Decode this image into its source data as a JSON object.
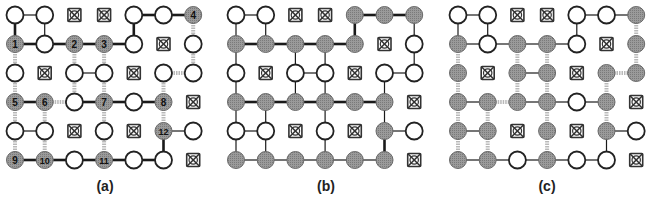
{
  "figure": {
    "grid": {
      "rows": 6,
      "cols": 7,
      "spacing_x": 29.7,
      "spacing_y": 29,
      "node_radius": 8.5
    },
    "colors": {
      "node_stroke": "#222222",
      "node_open_fill": "#ffffff",
      "node_shaded_fill": "#8f8f8f",
      "edge_black": "#1a1a1a",
      "edge_grey": "#b9b9b9",
      "blocked": "#333333",
      "label_text": "#111111"
    },
    "legend": {
      "O": "open node",
      "S": "shaded node",
      "X": "blocked node (crossed)"
    },
    "panels": [
      {
        "id": "a",
        "label": "(a)",
        "origin_x": 15,
        "origin_y": 15,
        "label_x": 105,
        "cells": [
          [
            "O",
            "O",
            "X",
            "X",
            "O",
            "O",
            "S"
          ],
          [
            "S",
            "O",
            "S",
            "S",
            "O",
            "X",
            "O"
          ],
          [
            "O",
            "X",
            "O",
            "O",
            "X",
            "O",
            "O"
          ],
          [
            "S",
            "S",
            "O",
            "S",
            "O",
            "S",
            "X"
          ],
          [
            "O",
            "O",
            "X",
            "O",
            "X",
            "S",
            "O"
          ],
          [
            "S",
            "S",
            "O",
            "S",
            "O",
            "O",
            "X"
          ]
        ],
        "node_numbers": [
          {
            "r": 0,
            "c": 6,
            "n": "4"
          },
          {
            "r": 1,
            "c": 0,
            "n": "1"
          },
          {
            "r": 1,
            "c": 2,
            "n": "2"
          },
          {
            "r": 1,
            "c": 3,
            "n": "3"
          },
          {
            "r": 3,
            "c": 0,
            "n": "5"
          },
          {
            "r": 3,
            "c": 1,
            "n": "6"
          },
          {
            "r": 3,
            "c": 3,
            "n": "7"
          },
          {
            "r": 3,
            "c": 5,
            "n": "8"
          },
          {
            "r": 4,
            "c": 5,
            "n": "12"
          },
          {
            "r": 5,
            "c": 0,
            "n": "9"
          },
          {
            "r": 5,
            "c": 1,
            "n": "10"
          },
          {
            "r": 5,
            "c": 3,
            "n": "11"
          }
        ],
        "edges": [
          [
            0,
            0,
            0,
            1,
            "t"
          ],
          [
            0,
            4,
            0,
            5,
            "b"
          ],
          [
            0,
            5,
            0,
            6,
            "b"
          ],
          [
            0,
            0,
            1,
            0,
            "b"
          ],
          [
            0,
            1,
            1,
            1,
            "t"
          ],
          [
            0,
            4,
            1,
            4,
            "b"
          ],
          [
            0,
            6,
            1,
            6,
            "g"
          ],
          [
            1,
            0,
            1,
            1,
            "b"
          ],
          [
            1,
            1,
            1,
            2,
            "b"
          ],
          [
            1,
            2,
            1,
            3,
            "b"
          ],
          [
            1,
            3,
            1,
            4,
            "b"
          ],
          [
            1,
            0,
            2,
            0,
            "g"
          ],
          [
            1,
            2,
            2,
            2,
            "g"
          ],
          [
            1,
            3,
            2,
            3,
            "g"
          ],
          [
            1,
            6,
            2,
            6,
            "g"
          ],
          [
            2,
            2,
            2,
            3,
            "t"
          ],
          [
            2,
            5,
            2,
            6,
            "g"
          ],
          [
            2,
            0,
            3,
            0,
            "g"
          ],
          [
            2,
            2,
            3,
            2,
            "g"
          ],
          [
            2,
            3,
            3,
            3,
            "g"
          ],
          [
            2,
            5,
            3,
            5,
            "g"
          ],
          [
            3,
            0,
            3,
            1,
            "b"
          ],
          [
            3,
            1,
            3,
            2,
            "g"
          ],
          [
            3,
            2,
            3,
            3,
            "b"
          ],
          [
            3,
            3,
            3,
            4,
            "b"
          ],
          [
            3,
            4,
            3,
            5,
            "b"
          ],
          [
            3,
            0,
            4,
            0,
            "g"
          ],
          [
            3,
            1,
            4,
            1,
            "g"
          ],
          [
            3,
            3,
            4,
            3,
            "g"
          ],
          [
            3,
            5,
            4,
            5,
            "g"
          ],
          [
            4,
            0,
            4,
            1,
            "t"
          ],
          [
            4,
            5,
            4,
            6,
            "t"
          ],
          [
            4,
            0,
            5,
            0,
            "g"
          ],
          [
            4,
            1,
            5,
            1,
            "g"
          ],
          [
            4,
            3,
            5,
            3,
            "g"
          ],
          [
            4,
            5,
            5,
            5,
            "b"
          ],
          [
            5,
            0,
            5,
            1,
            "b"
          ],
          [
            5,
            1,
            5,
            2,
            "b"
          ],
          [
            5,
            2,
            5,
            3,
            "b"
          ],
          [
            5,
            3,
            5,
            4,
            "b"
          ],
          [
            5,
            4,
            5,
            5,
            "b"
          ]
        ]
      },
      {
        "id": "b",
        "label": "(b)",
        "origin_x": 236,
        "origin_y": 15,
        "label_x": 326,
        "cells": [
          [
            "O",
            "O",
            "X",
            "X",
            "S",
            "S",
            "S"
          ],
          [
            "S",
            "S",
            "S",
            "S",
            "S",
            "X",
            "O"
          ],
          [
            "O",
            "X",
            "O",
            "O",
            "X",
            "O",
            "O"
          ],
          [
            "S",
            "S",
            "S",
            "S",
            "S",
            "S",
            "X"
          ],
          [
            "O",
            "O",
            "X",
            "O",
            "X",
            "S",
            "O"
          ],
          [
            "S",
            "S",
            "S",
            "S",
            "S",
            "S",
            "X"
          ]
        ],
        "node_numbers": [],
        "edges": [
          [
            0,
            0,
            0,
            1,
            "t"
          ],
          [
            0,
            4,
            0,
            5,
            "b"
          ],
          [
            0,
            5,
            0,
            6,
            "b"
          ],
          [
            0,
            0,
            1,
            0,
            "t"
          ],
          [
            0,
            1,
            1,
            1,
            "t"
          ],
          [
            0,
            4,
            1,
            4,
            "b"
          ],
          [
            0,
            6,
            1,
            6,
            "t"
          ],
          [
            1,
            0,
            1,
            1,
            "b"
          ],
          [
            1,
            1,
            1,
            2,
            "b"
          ],
          [
            1,
            2,
            1,
            3,
            "b"
          ],
          [
            1,
            3,
            1,
            4,
            "b"
          ],
          [
            1,
            0,
            2,
            0,
            "t"
          ],
          [
            1,
            2,
            2,
            2,
            "t"
          ],
          [
            1,
            3,
            2,
            3,
            "t"
          ],
          [
            1,
            6,
            2,
            6,
            "t"
          ],
          [
            2,
            2,
            2,
            3,
            "t"
          ],
          [
            2,
            5,
            2,
            6,
            "t"
          ],
          [
            2,
            0,
            3,
            0,
            "t"
          ],
          [
            2,
            2,
            3,
            2,
            "t"
          ],
          [
            2,
            3,
            3,
            3,
            "t"
          ],
          [
            2,
            5,
            3,
            5,
            "t"
          ],
          [
            3,
            0,
            3,
            1,
            "b"
          ],
          [
            3,
            1,
            3,
            2,
            "b"
          ],
          [
            3,
            2,
            3,
            3,
            "b"
          ],
          [
            3,
            3,
            3,
            4,
            "b"
          ],
          [
            3,
            4,
            3,
            5,
            "b"
          ],
          [
            3,
            0,
            4,
            0,
            "t"
          ],
          [
            3,
            1,
            4,
            1,
            "t"
          ],
          [
            3,
            3,
            4,
            3,
            "t"
          ],
          [
            3,
            5,
            4,
            5,
            "t"
          ],
          [
            4,
            0,
            4,
            1,
            "t"
          ],
          [
            4,
            5,
            4,
            6,
            "t"
          ],
          [
            4,
            0,
            5,
            0,
            "t"
          ],
          [
            4,
            1,
            5,
            1,
            "t"
          ],
          [
            4,
            3,
            5,
            3,
            "t"
          ],
          [
            4,
            5,
            5,
            5,
            "b"
          ],
          [
            5,
            0,
            5,
            1,
            "t"
          ],
          [
            5,
            1,
            5,
            2,
            "t"
          ],
          [
            5,
            2,
            5,
            3,
            "t"
          ],
          [
            5,
            3,
            5,
            4,
            "t"
          ],
          [
            5,
            4,
            5,
            5,
            "t"
          ]
        ]
      },
      {
        "id": "c",
        "label": "(c)",
        "origin_x": 458,
        "origin_y": 15,
        "label_x": 547,
        "cells": [
          [
            "O",
            "O",
            "X",
            "X",
            "O",
            "O",
            "S"
          ],
          [
            "S",
            "O",
            "S",
            "S",
            "O",
            "X",
            "S"
          ],
          [
            "S",
            "X",
            "S",
            "S",
            "X",
            "S",
            "S"
          ],
          [
            "S",
            "S",
            "S",
            "S",
            "O",
            "S",
            "X"
          ],
          [
            "S",
            "S",
            "X",
            "S",
            "X",
            "S",
            "O"
          ],
          [
            "S",
            "S",
            "O",
            "S",
            "O",
            "O",
            "X"
          ]
        ],
        "node_numbers": [],
        "edges": [
          [
            0,
            0,
            0,
            1,
            "t"
          ],
          [
            0,
            4,
            0,
            5,
            "t"
          ],
          [
            0,
            5,
            0,
            6,
            "t"
          ],
          [
            0,
            0,
            1,
            0,
            "t"
          ],
          [
            0,
            1,
            1,
            1,
            "t"
          ],
          [
            0,
            4,
            1,
            4,
            "t"
          ],
          [
            0,
            6,
            1,
            6,
            "g"
          ],
          [
            1,
            0,
            1,
            1,
            "t"
          ],
          [
            1,
            1,
            1,
            2,
            "t"
          ],
          [
            1,
            2,
            1,
            3,
            "t"
          ],
          [
            1,
            3,
            1,
            4,
            "t"
          ],
          [
            1,
            0,
            2,
            0,
            "g"
          ],
          [
            1,
            2,
            2,
            2,
            "g"
          ],
          [
            1,
            3,
            2,
            3,
            "g"
          ],
          [
            1,
            6,
            2,
            6,
            "g"
          ],
          [
            2,
            2,
            2,
            3,
            "t"
          ],
          [
            2,
            5,
            2,
            6,
            "g"
          ],
          [
            2,
            0,
            3,
            0,
            "g"
          ],
          [
            2,
            2,
            3,
            2,
            "g"
          ],
          [
            2,
            3,
            3,
            3,
            "g"
          ],
          [
            2,
            5,
            3,
            5,
            "g"
          ],
          [
            3,
            0,
            3,
            1,
            "t"
          ],
          [
            3,
            1,
            3,
            2,
            "g"
          ],
          [
            3,
            2,
            3,
            3,
            "t"
          ],
          [
            3,
            3,
            3,
            4,
            "t"
          ],
          [
            3,
            4,
            3,
            5,
            "t"
          ],
          [
            3,
            0,
            4,
            0,
            "g"
          ],
          [
            3,
            1,
            4,
            1,
            "g"
          ],
          [
            3,
            3,
            4,
            3,
            "g"
          ],
          [
            3,
            5,
            4,
            5,
            "g"
          ],
          [
            4,
            0,
            4,
            1,
            "t"
          ],
          [
            4,
            5,
            4,
            6,
            "t"
          ],
          [
            4,
            0,
            5,
            0,
            "g"
          ],
          [
            4,
            1,
            5,
            1,
            "g"
          ],
          [
            4,
            3,
            5,
            3,
            "g"
          ],
          [
            4,
            5,
            5,
            5,
            "t"
          ],
          [
            5,
            0,
            5,
            1,
            "t"
          ],
          [
            5,
            1,
            5,
            2,
            "t"
          ],
          [
            5,
            2,
            5,
            3,
            "t"
          ],
          [
            5,
            3,
            5,
            4,
            "t"
          ],
          [
            5,
            4,
            5,
            5,
            "t"
          ]
        ]
      }
    ]
  }
}
